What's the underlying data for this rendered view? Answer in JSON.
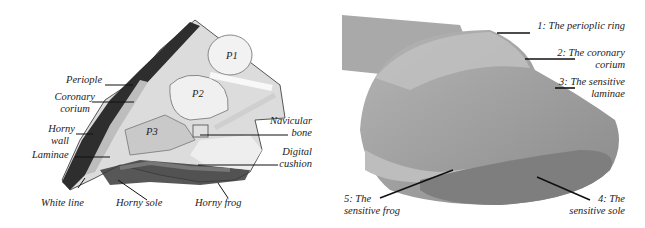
{
  "left_figure": {
    "bones": [
      "P1",
      "P2",
      "P3"
    ],
    "labels": {
      "periople": "Periople",
      "coronary_1": "Coronary",
      "coronary_2": "corium",
      "horny_wall_1": "Horny",
      "horny_wall_2": "wall",
      "laminae": "Laminae",
      "white_line": "White line",
      "horny_sole": "Horny sole",
      "horny_frog": "Horny frog",
      "navicular_1": "Navicular",
      "navicular_2": "bone",
      "digital_1": "Digital",
      "digital_2": "cushion"
    }
  },
  "right_figure": {
    "labels": {
      "l1": "1: The perioplic ring",
      "l2a": "2: The coronary",
      "l2b": "corium",
      "l3a": "3: The sensitive",
      "l3b": "laminae",
      "l4a": "4: The",
      "l4b": "sensitive sole",
      "l5a": "5: The",
      "l5b": "sensitive frog"
    }
  },
  "colors": {
    "label_text": "#222222",
    "leader_line": "#111111",
    "hoof_dark": "#333333",
    "hoof_gray": "#8a8a8a",
    "tissue_light": "#e6e6e6"
  }
}
